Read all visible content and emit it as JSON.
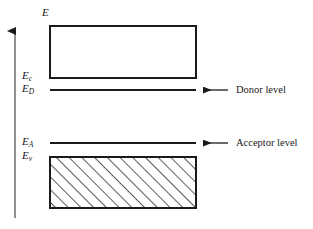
{
  "figure": {
    "type": "semiconductor-band-diagram",
    "title": "",
    "background_color": "#ffffff",
    "line_color": "#1a1a1a",
    "axis": {
      "name": "energy-axis",
      "label": "E",
      "direction": "up",
      "x": 15,
      "y_top": 28,
      "y_bottom": 218
    },
    "bands": {
      "conduction": {
        "name": "conduction-band",
        "fill": "none",
        "x": 50,
        "y": 26,
        "width": 146,
        "height": 52
      },
      "valence": {
        "name": "valence-band",
        "fill": "diagonal-hatch",
        "x": 50,
        "y": 157,
        "width": 146,
        "height": 51
      }
    },
    "levels": [
      {
        "name": "donor-level",
        "label": "Donor level",
        "energy_label": "E",
        "energy_subscript": "D",
        "y": 90,
        "x_start": 50,
        "x_end": 196
      },
      {
        "name": "acceptor-level",
        "label": "Acceptor level",
        "energy_label": "E",
        "energy_subscript": "A",
        "y": 143,
        "x_start": 50,
        "x_end": 196
      }
    ],
    "edge_labels": [
      {
        "name": "conduction-band-edge-label",
        "symbol": "E",
        "subscript": "c",
        "y": 76
      },
      {
        "name": "donor-level-label",
        "symbol": "E",
        "subscript": "D",
        "y": 88
      },
      {
        "name": "acceptor-level-label",
        "symbol": "E",
        "subscript": "A",
        "y": 141
      },
      {
        "name": "valence-band-edge-label",
        "symbol": "E",
        "subscript": "v",
        "y": 155
      }
    ],
    "annotations": [
      {
        "name": "donor-annotation",
        "text": "Donor level",
        "arrow_x_start": 228,
        "arrow_x_end": 200,
        "y": 90
      },
      {
        "name": "acceptor-annotation",
        "text": "Acceptor level",
        "arrow_x_start": 228,
        "arrow_x_end": 200,
        "y": 143
      }
    ]
  }
}
